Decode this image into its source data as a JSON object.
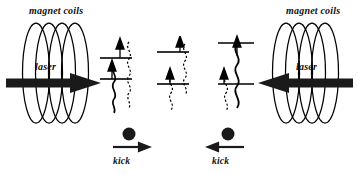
{
  "figure": {
    "type": "physics-schematic",
    "background_color": "#ffffff",
    "ink_color": "#000000",
    "width": 358,
    "height": 174
  },
  "left_assembly": {
    "coils_label": "magnet coils",
    "laser_label": "laser",
    "laser_beam_direction": "right",
    "coil_count": 4
  },
  "right_assembly": {
    "coils_label": "magnet coils",
    "laser_label": "laser",
    "laser_beam_direction": "left",
    "coil_count": 4
  },
  "level_diagrams": [
    {
      "id": "left-levels",
      "upper_level_style": "solid",
      "lower_level_style": "solid",
      "arrows": 2,
      "wave_solid": true,
      "wave_dashed": true
    },
    {
      "id": "middle-levels",
      "upper_level_style": "solid",
      "lower_level_style": "solid",
      "arrows": 2,
      "wave_solid": false,
      "wave_dashed": true
    },
    {
      "id": "right-levels",
      "upper_level_style": "solid",
      "lower_level_style": "solid",
      "arrows": 2,
      "wave_solid": true,
      "wave_dashed": true
    }
  ],
  "kicks": [
    {
      "id": "left-kick",
      "label": "kick",
      "direction": "right",
      "atom": "filled-circle"
    },
    {
      "id": "right-kick",
      "label": "kick",
      "direction": "left",
      "atom": "filled-circle"
    }
  ]
}
